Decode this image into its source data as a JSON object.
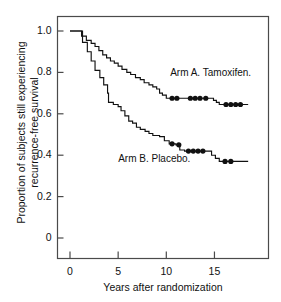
{
  "chart_data": {
    "type": "line",
    "title": "",
    "xlabel": "Years after randomization",
    "ylabel": "Proportion of subjects still experiencing\nrecurrence-free survival",
    "xlim": [
      -1.2,
      20.6
    ],
    "ylim": [
      -0.19,
      1.075
    ],
    "xticks": [
      0,
      5,
      10,
      15
    ],
    "xtick_labels": [
      "0",
      "5",
      "10",
      "15"
    ],
    "yticks": [
      0,
      0.2,
      0.4,
      0.6,
      0.8,
      1.0
    ],
    "ytick_labels": [
      "0",
      "0.2",
      "0.4",
      "0.6",
      "0.8",
      "1.0"
    ],
    "grid": false,
    "legend_position": "inline-annotations",
    "series": [
      {
        "name": "Arm A. Tamoxifen.",
        "annotation": "Arm A. Tamoxifen.",
        "annotation_x": 10.4,
        "annotation_y": 0.79,
        "step_type": "post",
        "points": [
          [
            0.0,
            1.0
          ],
          [
            1.0,
            1.0
          ],
          [
            1.2,
            0.975
          ],
          [
            1.7,
            0.955
          ],
          [
            2.2,
            0.94
          ],
          [
            2.6,
            0.925
          ],
          [
            3.0,
            0.905
          ],
          [
            3.4,
            0.885
          ],
          [
            3.8,
            0.87
          ],
          [
            4.2,
            0.855
          ],
          [
            4.6,
            0.845
          ],
          [
            5.0,
            0.83
          ],
          [
            5.4,
            0.815
          ],
          [
            5.9,
            0.8
          ],
          [
            6.3,
            0.79
          ],
          [
            6.8,
            0.775
          ],
          [
            7.3,
            0.765
          ],
          [
            7.7,
            0.75
          ],
          [
            8.2,
            0.74
          ],
          [
            8.6,
            0.73
          ],
          [
            9.0,
            0.72
          ],
          [
            9.3,
            0.7
          ],
          [
            9.6,
            0.69
          ],
          [
            10.0,
            0.675
          ],
          [
            14.6,
            0.675
          ],
          [
            14.9,
            0.665
          ],
          [
            15.2,
            0.655
          ],
          [
            15.5,
            0.645
          ],
          [
            18.5,
            0.645
          ]
        ],
        "censor_marks": [
          [
            10.6,
            0.675
          ],
          [
            11.1,
            0.675
          ],
          [
            12.5,
            0.675
          ],
          [
            13.0,
            0.675
          ],
          [
            13.5,
            0.675
          ],
          [
            14.1,
            0.675
          ],
          [
            16.2,
            0.645
          ],
          [
            16.7,
            0.645
          ],
          [
            17.2,
            0.645
          ],
          [
            17.7,
            0.645
          ]
        ]
      },
      {
        "name": "Arm B. Placebo.",
        "annotation": "Arm B. Placebo.",
        "annotation_x": 5.0,
        "annotation_y": 0.375,
        "step_type": "post",
        "points": [
          [
            0.0,
            1.0
          ],
          [
            0.9,
            1.0
          ],
          [
            1.3,
            0.945
          ],
          [
            1.8,
            0.9
          ],
          [
            2.2,
            0.855
          ],
          [
            2.6,
            0.81
          ],
          [
            3.1,
            0.775
          ],
          [
            3.5,
            0.74
          ],
          [
            3.9,
            0.7
          ],
          [
            4.0,
            0.655
          ],
          [
            4.5,
            0.645
          ],
          [
            5.0,
            0.635
          ],
          [
            5.3,
            0.615
          ],
          [
            5.7,
            0.59
          ],
          [
            6.1,
            0.565
          ],
          [
            6.5,
            0.555
          ],
          [
            6.9,
            0.535
          ],
          [
            7.3,
            0.525
          ],
          [
            7.8,
            0.515
          ],
          [
            8.2,
            0.505
          ],
          [
            8.6,
            0.495
          ],
          [
            9.3,
            0.49
          ],
          [
            9.8,
            0.47
          ],
          [
            10.3,
            0.455
          ],
          [
            11.0,
            0.45
          ],
          [
            11.4,
            0.425
          ],
          [
            11.9,
            0.42
          ],
          [
            14.3,
            0.42
          ],
          [
            14.7,
            0.4
          ],
          [
            15.1,
            0.385
          ],
          [
            15.5,
            0.37
          ],
          [
            18.5,
            0.37
          ]
        ],
        "censor_marks": [
          [
            10.6,
            0.455
          ],
          [
            11.3,
            0.45
          ],
          [
            12.3,
            0.42
          ],
          [
            12.8,
            0.42
          ],
          [
            13.3,
            0.42
          ],
          [
            13.8,
            0.42
          ],
          [
            16.1,
            0.37
          ],
          [
            16.7,
            0.37
          ]
        ]
      }
    ]
  },
  "axes": {
    "ylabel_line1": "Proportion of subjects still experiencing",
    "ylabel_line2": "recurrence-free survival",
    "xlabel": "Years after randomization"
  }
}
